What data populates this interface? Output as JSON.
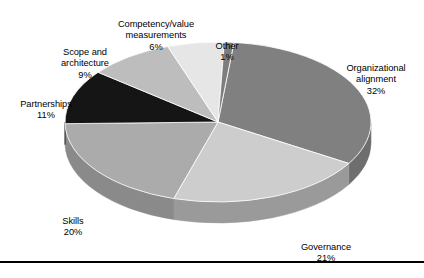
{
  "chart_data": {
    "type": "pie",
    "title": "",
    "subtitle": "",
    "xlabel": "",
    "ylabel": "",
    "legend_position": "none",
    "grid": false,
    "labels_show_percent": true,
    "categories": [
      "Organizational alignment",
      "Governance",
      "Skills",
      "Partnerships",
      "Scope and architecture",
      "Competency/value measurements",
      "Other"
    ],
    "values": [
      32,
      21,
      20,
      11,
      9,
      6,
      1
    ],
    "value_suffix": "%",
    "total": 100,
    "slices": [
      {
        "name": "Organizational alignment",
        "label": "Organizational\nalignment",
        "value": 32,
        "value_text": "32%",
        "color": "#808080",
        "side_color": "#6e6e6e"
      },
      {
        "name": "Governance",
        "label": "Governance",
        "value": 21,
        "value_text": "21%",
        "color": "#cdcdcd",
        "side_color": "#9a9a9a"
      },
      {
        "name": "Skills",
        "label": "Skills",
        "value": 20,
        "value_text": "20%",
        "color": "#ababab",
        "side_color": "#8a8a8a"
      },
      {
        "name": "Partnerships",
        "label": "Partnerships",
        "value": 11,
        "value_text": "11%",
        "color": "#151515",
        "side_color": "#151515"
      },
      {
        "name": "Scope and architecture",
        "label": "Scope and\narchitecture",
        "value": 9,
        "value_text": "9%",
        "color": "#bdbdbd",
        "side_color": "#9a9a9a"
      },
      {
        "name": "Competency/value measurements",
        "label": "Competency/value\nmeasurements",
        "value": 6,
        "value_text": "6%",
        "color": "#e6e6e6",
        "side_color": "#b5b5b5"
      },
      {
        "name": "Other",
        "label": "Other",
        "value": 1,
        "value_text": "1%",
        "color": "#7d7d7d",
        "side_color": "#6e6e6e"
      }
    ]
  },
  "labels": {
    "organizational_alignment": {
      "text": "Organizational\nalignment",
      "value": "32%"
    },
    "governance": {
      "text": "Governance",
      "value": "21%"
    },
    "skills": {
      "text": "Skills",
      "value": "20%"
    },
    "partnerships": {
      "text": "Partnerships",
      "value": "11%"
    },
    "scope_and_architecture": {
      "text": "Scope and\narchitecture",
      "value": "9%"
    },
    "competency_value_measurements": {
      "text": "Competency/value\nmeasurements",
      "value": "6%"
    },
    "other": {
      "text": "Other",
      "value": "1%"
    }
  },
  "geometry": {
    "center_x": 218,
    "center_y": 122,
    "radius_x": 153,
    "radius_y": 80,
    "depth": 21,
    "start_angle_deg": -84
  },
  "rule": {
    "color": "#000000"
  }
}
